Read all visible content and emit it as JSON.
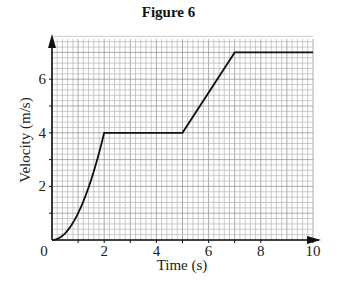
{
  "chart_data": {
    "type": "line",
    "title": "Figure 6",
    "xlabel": "Time (s)",
    "ylabel": "Velocity (m/s)",
    "xlim": [
      0,
      10
    ],
    "ylim": [
      0,
      7.5
    ],
    "xticks": [
      0,
      2,
      4,
      6,
      8,
      10
    ],
    "yticks": [
      2,
      4,
      6
    ],
    "grid": true,
    "grid_minor_x": 0.2,
    "grid_minor_y": 0.2,
    "legend": null,
    "series": [
      {
        "name": "velocity",
        "segments": [
          {
            "type": "curve",
            "desc": "accelerating curve (increasing gradient)",
            "points": [
              [
                0,
                0
              ],
              [
                0.5,
                0.25
              ],
              [
                1,
                1
              ],
              [
                1.5,
                2.25
              ],
              [
                2,
                4
              ]
            ]
          },
          {
            "type": "line",
            "points": [
              [
                2,
                4
              ],
              [
                5,
                4
              ]
            ]
          },
          {
            "type": "line",
            "points": [
              [
                5,
                4
              ],
              [
                7,
                7
              ]
            ]
          },
          {
            "type": "line",
            "points": [
              [
                7,
                7
              ],
              [
                10,
                7
              ]
            ]
          }
        ],
        "x": [
          0,
          0.5,
          1,
          1.5,
          2,
          5,
          7,
          10
        ],
        "y": [
          0,
          0.25,
          1,
          2.25,
          4,
          4,
          7,
          7
        ]
      }
    ]
  }
}
